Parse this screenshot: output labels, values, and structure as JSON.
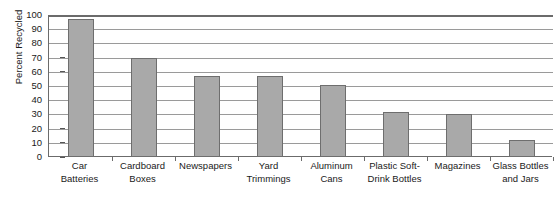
{
  "chart_data": {
    "type": "bar",
    "title": "",
    "xlabel": "",
    "ylabel": "Percent Recycled",
    "ylim": [
      0,
      100
    ],
    "ytick_step": 10,
    "yticks": [
      100,
      90,
      80,
      70,
      60,
      50,
      40,
      30,
      20,
      10,
      0
    ],
    "grid": true,
    "legend": null,
    "bar_color": "#a9a9a9",
    "bar_edge_color": "#6e6e6e",
    "axis_color": "#6b6b6b",
    "gridline_color": "#9a9a9a",
    "categories": [
      "Car Batteries",
      "Cardboard Boxes",
      "Newspapers",
      "Yard Trimmings",
      "Aluminum Cans",
      "Plastic Soft-Drink Bottles",
      "Magazines",
      "Glass Bottles and Jars"
    ],
    "category_lines": [
      [
        "Car",
        "Batteries"
      ],
      [
        "Cardboard",
        "Boxes"
      ],
      [
        "Newspapers",
        ""
      ],
      [
        "Yard",
        "Trimmings"
      ],
      [
        "Aluminum",
        "Cans"
      ],
      [
        "Plastic Soft-",
        "Drink Bottles"
      ],
      [
        "Magazines",
        ""
      ],
      [
        "Glass Bottles",
        "and Jars"
      ]
    ],
    "values": [
      97,
      70,
      57,
      57,
      51,
      32,
      30,
      12
    ]
  }
}
